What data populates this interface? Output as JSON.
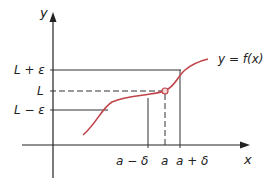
{
  "diagram": {
    "axes": {
      "x_label": "x",
      "y_label": "y"
    },
    "y_ticks": {
      "L_plus_eps": "L + ε",
      "L": "L",
      "L_minus_eps": "L − ε"
    },
    "x_ticks": {
      "a_minus_delta": "a − δ",
      "a": "a",
      "a_plus_delta": "a + δ"
    },
    "curve_label": "y = f(x)",
    "colors": {
      "curve": "#c0444a",
      "axes": "#222222",
      "guides": "#333333"
    }
  }
}
